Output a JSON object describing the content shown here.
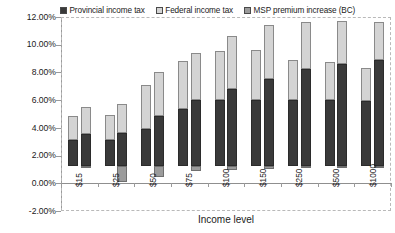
{
  "chart_data": {
    "type": "bar",
    "subtype": "grouped-stacked",
    "title": "",
    "xlabel": "Income level",
    "ylabel": "",
    "ylim": [
      -2.0,
      12.0
    ],
    "ytick_step": 2.0,
    "ytick_labels": [
      "12.00%",
      "10.00%",
      "8.00%",
      "6.00%",
      "4.00%",
      "2.00%",
      "0.00%",
      "-2.00%"
    ],
    "ytick_values": [
      12.0,
      10.0,
      8.0,
      6.0,
      4.0,
      2.0,
      0.0,
      -2.0
    ],
    "grid": false,
    "legend_position": "top",
    "categories": [
      "$15",
      "$25",
      "$50",
      "$75",
      "$100",
      "$150",
      "$250",
      "$500",
      "$1000"
    ],
    "bars_per_category": 2,
    "stack_order": [
      "Provincial income tax",
      "Federal income tax",
      "MSP premium increase (BC)"
    ],
    "series": [
      {
        "name": "Provincial income tax",
        "color": "#3a3a3a",
        "values_bar1": [
          1.9,
          1.9,
          2.7,
          4.1,
          4.8,
          4.8,
          4.8,
          4.8,
          4.7
        ],
        "values_bar2": [
          2.3,
          2.4,
          3.6,
          4.8,
          5.6,
          6.3,
          7.0,
          7.4,
          7.7
        ]
      },
      {
        "name": "Federal income tax",
        "color": "#d4d4d4",
        "values_bar1": [
          1.7,
          1.8,
          3.2,
          3.5,
          3.5,
          3.6,
          2.9,
          2.7,
          2.4
        ],
        "values_bar2": [
          2.0,
          2.1,
          3.2,
          3.4,
          3.8,
          3.9,
          3.4,
          3.1,
          2.7
        ]
      },
      {
        "name": "MSP premium increase (BC)",
        "color": "#9b9b9b",
        "values_bar1": [
          0.0,
          0.0,
          0.0,
          0.0,
          0.0,
          0.0,
          0.0,
          0.0,
          0.0
        ],
        "values_bar2": [
          -0.15,
          -1.15,
          -0.75,
          -0.35,
          -0.3,
          -0.2,
          -0.15,
          -0.1,
          -0.05
        ]
      }
    ],
    "totals_bar1": [
      3.6,
      3.7,
      5.9,
      7.6,
      8.3,
      8.4,
      7.7,
      7.5,
      7.1
    ],
    "totals_bar2": [
      4.3,
      4.5,
      6.8,
      8.2,
      9.4,
      10.2,
      10.4,
      10.5,
      10.4
    ]
  },
  "legend": {
    "items": [
      {
        "label": "Provincial income tax",
        "swatch": "#3a3a3a"
      },
      {
        "label": "Federal income tax",
        "swatch": "#d4d4d4"
      },
      {
        "label": "MSP premium increase (BC)",
        "swatch": "#9b9b9b"
      }
    ]
  },
  "axes": {
    "x_title": "Income level"
  }
}
